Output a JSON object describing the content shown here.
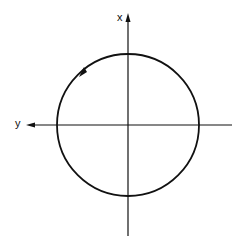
{
  "diagram": {
    "axes": {
      "vertical_label": "x",
      "horizontal_label": "y"
    },
    "circle": {
      "direction": "counterclockwise",
      "center": [
        128,
        125
      ],
      "radius": 71
    },
    "colors": {
      "stroke": "#111111",
      "background": "#ffffff"
    }
  }
}
